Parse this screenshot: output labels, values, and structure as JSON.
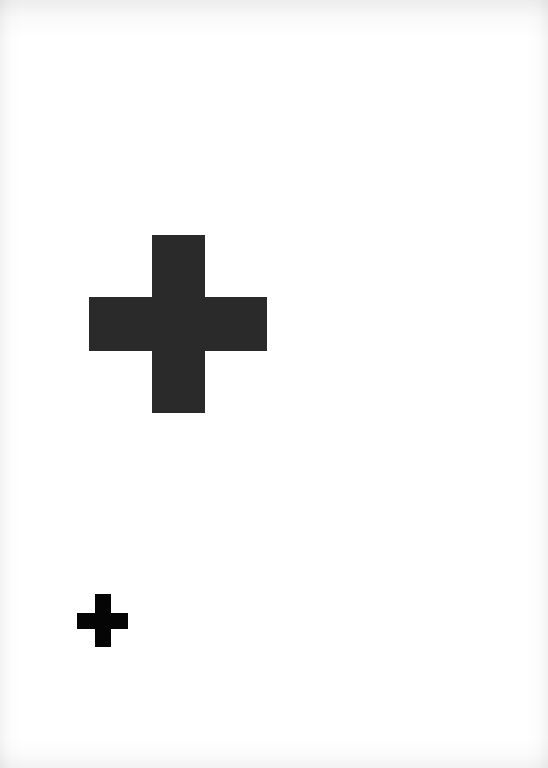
{
  "page": {
    "background": "#ffffff"
  },
  "marks": [
    {
      "name": "large-cross",
      "color": "#2a2a2a",
      "vertical": {
        "x": 152,
        "y": 235,
        "w": 53,
        "h": 178
      },
      "horizontal": {
        "x": 89,
        "y": 297,
        "w": 178,
        "h": 54
      }
    },
    {
      "name": "small-cross",
      "color": "#050505",
      "vertical": {
        "x": 95,
        "y": 594,
        "w": 16,
        "h": 53
      },
      "horizontal": {
        "x": 77,
        "y": 613,
        "w": 51,
        "h": 16
      }
    }
  ]
}
